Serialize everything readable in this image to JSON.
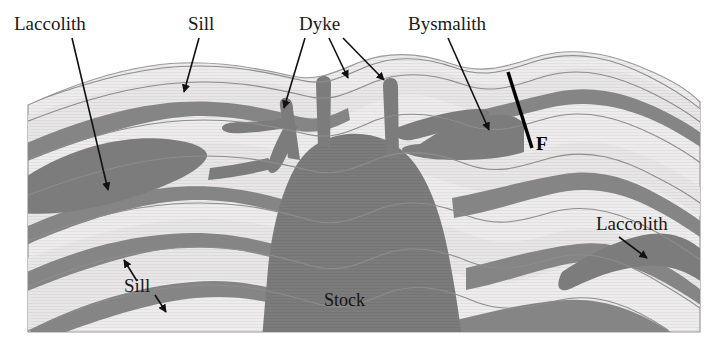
{
  "figure": {
    "background_color": "#ffffff",
    "width": 721,
    "height": 339
  },
  "colors": {
    "country_rock_light": "#eceaea",
    "country_rock_mid": "#e3e1e1",
    "intrusive_body": "#7c7c7c",
    "sill_band": "#858585",
    "bedding_line": "#8d8d8d",
    "label_text": "#1a1a1a",
    "fault_line": "#000000"
  },
  "labels": [
    {
      "id": "laccolith-top-left",
      "text": "Laccolith",
      "x": 14,
      "y": 30,
      "anchor": "start",
      "leaders": [
        {
          "x1": 72,
          "y1": 38,
          "x2": 108,
          "y2": 190
        }
      ]
    },
    {
      "id": "sill-top",
      "text": "Sill",
      "x": 188,
      "y": 30,
      "anchor": "start",
      "leaders": [
        {
          "x1": 199,
          "y1": 38,
          "x2": 184,
          "y2": 92
        }
      ]
    },
    {
      "id": "dyke-top",
      "text": "Dyke",
      "x": 299,
      "y": 30,
      "anchor": "start",
      "leaders": [
        {
          "x1": 305,
          "y1": 38,
          "x2": 284,
          "y2": 108
        },
        {
          "x1": 329,
          "y1": 38,
          "x2": 348,
          "y2": 78
        },
        {
          "x1": 343,
          "y1": 38,
          "x2": 384,
          "y2": 80
        }
      ]
    },
    {
      "id": "bysmalith-top",
      "text": "Bysmalith",
      "x": 408,
      "y": 30,
      "anchor": "start",
      "leaders": [
        {
          "x1": 448,
          "y1": 38,
          "x2": 489,
          "y2": 130
        }
      ]
    },
    {
      "id": "fault-marker",
      "text": "F",
      "x": 536,
      "y": 150,
      "anchor": "start",
      "leaders": []
    },
    {
      "id": "laccolith-right",
      "text": "Laccolith",
      "x": 596,
      "y": 230,
      "anchor": "start",
      "leaders": [
        {
          "x1": 619,
          "y1": 237,
          "x2": 647,
          "y2": 258
        }
      ]
    },
    {
      "id": "sill-lower-left",
      "text": "Sill",
      "x": 124,
      "y": 292,
      "anchor": "start",
      "leaders": [
        {
          "x1": 137,
          "y1": 281,
          "x2": 124,
          "y2": 260
        },
        {
          "x1": 155,
          "y1": 295,
          "x2": 166,
          "y2": 312
        }
      ]
    },
    {
      "id": "stock-body",
      "text": "Stock",
      "x": 324,
      "y": 306,
      "anchor": "start",
      "leaders": []
    }
  ],
  "fault": {
    "id": "fault-F",
    "x1": 508,
    "y1": 72,
    "x2": 532,
    "y2": 148
  },
  "geology": {
    "structures": [
      "stock",
      "dykes",
      "sills",
      "laccoliths",
      "bysmalith",
      "fault"
    ],
    "sedimentary_layer_count": 9
  }
}
